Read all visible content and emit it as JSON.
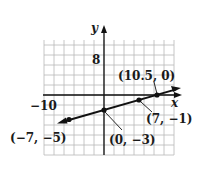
{
  "chart_data": {
    "type": "line",
    "title": "",
    "xlabel": "x",
    "ylabel": "y",
    "xlim": [
      -12,
      14
    ],
    "ylim": [
      -12,
      11
    ],
    "grid": true,
    "grid_step": 2,
    "tick_labels": {
      "x": [
        "-10"
      ],
      "y": [
        "8"
      ]
    },
    "series": [
      {
        "name": "line",
        "x": [
          -7,
          0,
          7,
          10.5
        ],
        "y": [
          -5,
          -3,
          -1,
          0
        ]
      }
    ],
    "points": [
      {
        "x": -7,
        "y": -5,
        "label": "(−7, −5)"
      },
      {
        "x": 0,
        "y": -3,
        "label": "(0, −3)"
      },
      {
        "x": 7,
        "y": -1,
        "label": "(7, −1)"
      },
      {
        "x": 10.5,
        "y": 0,
        "label": "(10.5, 0)"
      }
    ],
    "annotations": [
      "(10.5, 0)",
      "(7, −1)",
      "(0, −3)",
      "(−7, −5)"
    ]
  },
  "labels": {
    "x_axis": "x",
    "y_axis": "y",
    "tick_x_neg10": "−10",
    "tick_y_8": "8",
    "pt_a": "(−7, −5)",
    "pt_b": "(0, −3)",
    "pt_c": "(7, −1)",
    "pt_d": "(10.5, 0)"
  }
}
